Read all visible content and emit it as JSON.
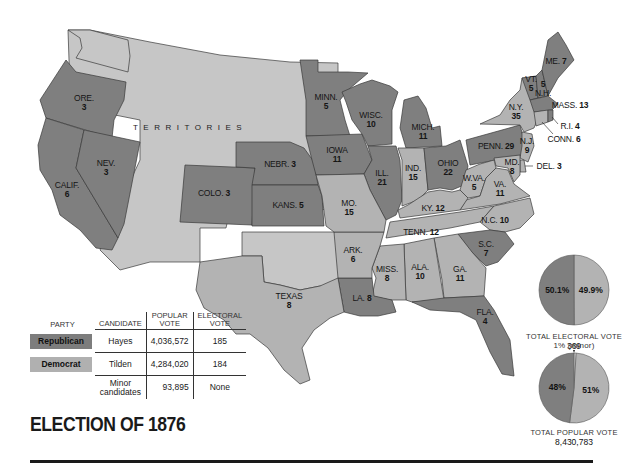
{
  "title": "ELECTION OF 1876",
  "colors": {
    "republican": "#7f7f7f",
    "democrat": "#b3b3b3",
    "territories": "#c6c6c6"
  },
  "map": {
    "territories_label": "TERRITORIES",
    "states": [
      {
        "id": "ore",
        "name": "ORE.",
        "votes": "3",
        "party": "republican"
      },
      {
        "id": "calif",
        "name": "CALIF.",
        "votes": "6",
        "party": "republican"
      },
      {
        "id": "nev",
        "name": "NEV.",
        "votes": "3",
        "party": "republican"
      },
      {
        "id": "colo",
        "name": "COLO.",
        "votes": "3",
        "party": "republican"
      },
      {
        "id": "nebr",
        "name": "NEBR.",
        "votes": "3",
        "party": "republican"
      },
      {
        "id": "kans",
        "name": "KANS.",
        "votes": "5",
        "party": "republican"
      },
      {
        "id": "minn",
        "name": "MINN.",
        "votes": "5",
        "party": "republican"
      },
      {
        "id": "iowa",
        "name": "IOWA",
        "votes": "11",
        "party": "republican"
      },
      {
        "id": "wisc",
        "name": "WISC.",
        "votes": "10",
        "party": "republican"
      },
      {
        "id": "ill",
        "name": "ILL.",
        "votes": "21",
        "party": "republican"
      },
      {
        "id": "mich",
        "name": "MICH.",
        "votes": "11",
        "party": "republican"
      },
      {
        "id": "ind",
        "name": "IND.",
        "votes": "15",
        "party": "democrat"
      },
      {
        "id": "ohio",
        "name": "OHIO",
        "votes": "22",
        "party": "republican"
      },
      {
        "id": "penn",
        "name": "PENN.",
        "votes": "29",
        "party": "republican"
      },
      {
        "id": "ny",
        "name": "N.Y.",
        "votes": "35",
        "party": "democrat"
      },
      {
        "id": "vt",
        "name": "VT.",
        "votes": "5",
        "party": "republican"
      },
      {
        "id": "nh",
        "name": "N.H.",
        "votes": "5",
        "party": "republican"
      },
      {
        "id": "me",
        "name": "ME.",
        "votes": "7",
        "party": "republican"
      },
      {
        "id": "mass",
        "name": "MASS.",
        "votes": "13",
        "party": "republican"
      },
      {
        "id": "ri",
        "name": "R.I.",
        "votes": "4",
        "party": "republican"
      },
      {
        "id": "conn",
        "name": "CONN.",
        "votes": "6",
        "party": "democrat"
      },
      {
        "id": "nj",
        "name": "N.J.",
        "votes": "9",
        "party": "democrat"
      },
      {
        "id": "del",
        "name": "DEL.",
        "votes": "3",
        "party": "democrat"
      },
      {
        "id": "md",
        "name": "MD.",
        "votes": "8",
        "party": "democrat"
      },
      {
        "id": "wva",
        "name": "W.VA.",
        "votes": "5",
        "party": "democrat"
      },
      {
        "id": "va",
        "name": "VA.",
        "votes": "11",
        "party": "democrat"
      },
      {
        "id": "ky",
        "name": "KY.",
        "votes": "12",
        "party": "democrat"
      },
      {
        "id": "tenn",
        "name": "TENN.",
        "votes": "12",
        "party": "democrat"
      },
      {
        "id": "nc",
        "name": "N.C.",
        "votes": "10",
        "party": "democrat"
      },
      {
        "id": "sc",
        "name": "S.C.",
        "votes": "7",
        "party": "republican"
      },
      {
        "id": "ga",
        "name": "GA.",
        "votes": "11",
        "party": "democrat"
      },
      {
        "id": "ala",
        "name": "ALA.",
        "votes": "10",
        "party": "democrat"
      },
      {
        "id": "miss",
        "name": "MISS.",
        "votes": "8",
        "party": "democrat"
      },
      {
        "id": "la",
        "name": "LA.",
        "votes": "8",
        "party": "republican"
      },
      {
        "id": "fla",
        "name": "FLA.",
        "votes": "4",
        "party": "republican"
      },
      {
        "id": "ark",
        "name": "ARK.",
        "votes": "6",
        "party": "democrat"
      },
      {
        "id": "mo",
        "name": "MO.",
        "votes": "15",
        "party": "democrat"
      },
      {
        "id": "texas",
        "name": "TEXAS",
        "votes": "8",
        "party": "democrat"
      }
    ]
  },
  "legend": {
    "headers": {
      "party": "PARTY",
      "candidate": "CANDIDATE",
      "popular_vote_1": "POPULAR",
      "popular_vote_2": "VOTE",
      "electoral_vote_1": "ELECTORAL",
      "electoral_vote_2": "VOTE"
    },
    "rows": [
      {
        "party": "Republican",
        "candidate": "Hayes",
        "popular": "4,036,572",
        "electoral": "185"
      },
      {
        "party": "Democrat",
        "candidate": "Tilden",
        "popular": "4,284,020",
        "electoral": "184"
      },
      {
        "party": "",
        "candidate_line1": "Minor",
        "candidate_line2": "candidates",
        "popular": "93,895",
        "electoral": "None"
      }
    ]
  },
  "chart_data": [
    {
      "type": "pie",
      "title": "TOTAL ELECTORAL VOTE",
      "total": "369",
      "slices": [
        {
          "name": "Republican",
          "value": 50.1,
          "label": "50.1%"
        },
        {
          "name": "Democrat",
          "value": 49.9,
          "label": "49.9%"
        }
      ]
    },
    {
      "type": "pie",
      "title": "TOTAL POPULAR VOTE",
      "total": "8,430,783",
      "annotation": "1% (minor)",
      "slices": [
        {
          "name": "Republican",
          "value": 48,
          "label": "48%"
        },
        {
          "name": "Minor",
          "value": 1,
          "label": "1% (minor)"
        },
        {
          "name": "Democrat",
          "value": 51,
          "label": "51%"
        }
      ]
    }
  ]
}
